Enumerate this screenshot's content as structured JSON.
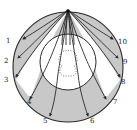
{
  "diagram": {
    "type": "radial-projection-diagram",
    "colors": {
      "shade": "#c8c8c8",
      "line": "#2a2a2a",
      "background": "#ffffff"
    },
    "labels": [
      {
        "id": 1,
        "text": "1",
        "x": 6,
        "y": 43
      },
      {
        "id": 2,
        "text": "2",
        "x": 4,
        "y": 63
      },
      {
        "id": 3,
        "text": "3",
        "x": 4,
        "y": 82
      },
      {
        "id": 4,
        "text": "4",
        "x": 27,
        "y": 104
      },
      {
        "id": 5,
        "text": "5",
        "x": 43,
        "y": 123
      },
      {
        "id": 6,
        "text": "6",
        "x": 90,
        "y": 123
      },
      {
        "id": 7,
        "text": "7",
        "x": 113,
        "y": 104
      },
      {
        "id": 8,
        "text": "8",
        "x": 121,
        "y": 84
      },
      {
        "id": 9,
        "text": "9",
        "x": 123,
        "y": 64
      },
      {
        "id": 10,
        "text": "10",
        "x": 118,
        "y": 44
      }
    ]
  }
}
